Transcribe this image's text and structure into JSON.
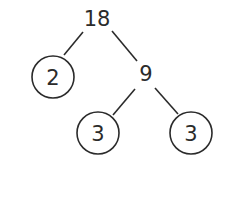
{
  "diagram": {
    "type": "factor-tree",
    "root": {
      "value": "18",
      "circled": false,
      "children": [
        {
          "value": "2",
          "circled": true
        },
        {
          "value": "9",
          "circled": false,
          "children": [
            {
              "value": "3",
              "circled": true
            },
            {
              "value": "3",
              "circled": true
            }
          ]
        }
      ]
    }
  },
  "labels": {
    "root": "18",
    "left_prime": "2",
    "composite": "9",
    "leaf_left": "3",
    "leaf_right": "3"
  },
  "colors": {
    "ink": "#2b2b2b",
    "background": "#ffffff"
  }
}
